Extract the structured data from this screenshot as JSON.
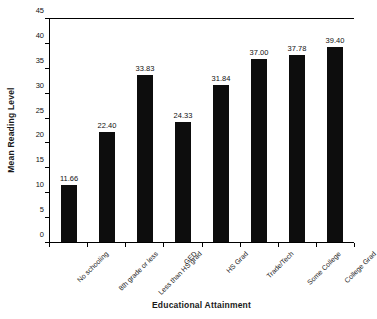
{
  "chart_data": {
    "type": "bar",
    "title": "",
    "xlabel": "Educational Attainment",
    "ylabel": "Mean Reading Level",
    "categories": [
      "No schooling",
      "8th grade or less",
      "Less than HS grad",
      "GED",
      "HS Grad",
      "Trade/Tech",
      "Some College",
      "College Grad"
    ],
    "values": [
      11.66,
      22.4,
      33.83,
      24.33,
      31.84,
      37.0,
      37.78,
      39.4
    ],
    "value_labels": [
      "11.66",
      "22.40",
      "33.83",
      "24.33",
      "31.84",
      "37.00",
      "37.78",
      "39.40"
    ],
    "ylim": [
      0,
      45
    ],
    "ytick_values": [
      0,
      5,
      10,
      15,
      20,
      25,
      30,
      35,
      40,
      45
    ],
    "ytick_labels": [
      "0",
      "5",
      "10",
      "15",
      "20",
      "25",
      "30",
      "35",
      "40",
      "45"
    ],
    "grid": false,
    "legend": false,
    "bar_color": "#0d0d0d",
    "axis_color": "#000000",
    "background": "#ffffff"
  }
}
